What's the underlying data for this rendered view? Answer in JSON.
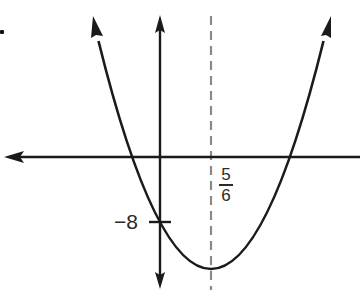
{
  "figure": {
    "type": "parabola graph",
    "labels": {
      "y_intercept": "−8",
      "axis_of_symmetry": {
        "numerator": "5",
        "denominator": "6"
      }
    },
    "colors": {
      "curve": "#1a1a1a",
      "axes": "#1a1a1a",
      "dashed_line": "#8a8a8a",
      "text": "#2a2a2a"
    }
  }
}
